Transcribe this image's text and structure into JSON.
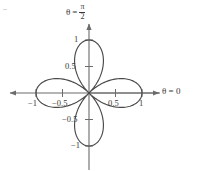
{
  "figure": {
    "title": "",
    "background_color": "#ffffff",
    "curve_color": "#4a4a4a",
    "axis_color": "#6b6b6b",
    "text_color": "#3a3a3a"
  },
  "labels": {
    "theta_axis_vertical": {
      "theta": "θ",
      "equals": "=",
      "numerator": "π",
      "denominator": "2"
    },
    "theta_axis_horizontal": "θ = 0"
  },
  "ticks": {
    "x_positive": [
      "0.5",
      "1"
    ],
    "x_negative": [
      "−0.5",
      "−1"
    ],
    "y_positive": [
      "0.5",
      "1"
    ],
    "y_negative": [
      "−0.5",
      "−1"
    ]
  },
  "chart_data": {
    "type": "line",
    "subtype": "polar-rose",
    "title": "",
    "xlabel": "θ = 0",
    "ylabel": "θ = π/2",
    "equation": "r = cos(2θ)",
    "petal_count": 4,
    "petal_directions_deg": [
      0,
      90,
      180,
      270
    ],
    "max_radius": 1,
    "xlim": [
      -1.45,
      1.45
    ],
    "ylim": [
      -1.45,
      1.45
    ],
    "xticks": [
      -1,
      -0.5,
      0.5,
      1
    ],
    "xticklabels": [
      "−1",
      "−0.5",
      "0.5",
      "1"
    ],
    "yticks": [
      -1,
      -0.5,
      0.5,
      1
    ],
    "yticklabels": [
      "−1",
      "−0.5",
      "0.5",
      "1"
    ],
    "grid": false,
    "legend": false,
    "axes_arrows": true,
    "theta_samples_deg": [
      0,
      5,
      10,
      15,
      20,
      25,
      30,
      35,
      40,
      45,
      50,
      55,
      60,
      65,
      70,
      75,
      80,
      85,
      90
    ],
    "r_values": [
      1.0,
      0.985,
      0.94,
      0.866,
      0.766,
      0.643,
      0.5,
      0.342,
      0.174,
      0.0,
      -0.174,
      -0.342,
      -0.5,
      -0.643,
      -0.766,
      -0.866,
      -0.94,
      -0.985,
      -1.0
    ],
    "axis_ranges_px": {
      "origin_x": 89,
      "origin_y": 93,
      "unit_px": 53
    }
  }
}
